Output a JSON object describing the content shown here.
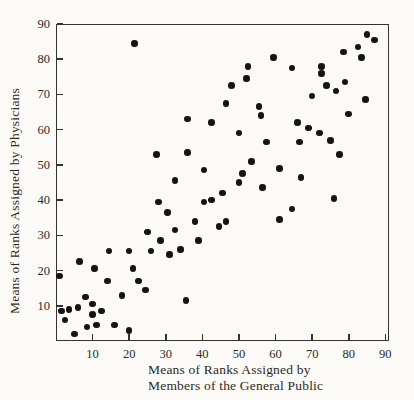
{
  "figure": {
    "background_color": "#fbfaf7",
    "ink_color": "#16140f",
    "axis_color": "#35332e"
  },
  "chart_data": {
    "type": "scatter",
    "title": "",
    "ylabel": "Means of Ranks Assigned by Physicians",
    "xlabel_lines": [
      "Means of Ranks Assigned by",
      "Members of the General Public"
    ],
    "xlim": [
      0,
      91
    ],
    "ylim": [
      0,
      90
    ],
    "x_ticks": [
      10,
      20,
      30,
      40,
      50,
      60,
      70,
      80,
      90
    ],
    "y_ticks": [
      10,
      20,
      30,
      40,
      50,
      60,
      70,
      80,
      90
    ],
    "grid": false,
    "legend": "none",
    "marker": "filled-circle",
    "points": [
      [
        1,
        18.5
      ],
      [
        6.5,
        22.5
      ],
      [
        10.5,
        20.5
      ],
      [
        14,
        17
      ],
      [
        8,
        12.5
      ],
      [
        18,
        13
      ],
      [
        1.5,
        8.5
      ],
      [
        3.5,
        9
      ],
      [
        6,
        9.5
      ],
      [
        10,
        10.5
      ],
      [
        2.5,
        6
      ],
      [
        10,
        7.5
      ],
      [
        12.5,
        8.5
      ],
      [
        8.5,
        4
      ],
      [
        11,
        4.5
      ],
      [
        16,
        4.5
      ],
      [
        20,
        3
      ],
      [
        5,
        2
      ],
      [
        22.5,
        17
      ],
      [
        24.5,
        14.5
      ],
      [
        35.5,
        11.5
      ],
      [
        25,
        31
      ],
      [
        28.5,
        28.5
      ],
      [
        26,
        25.5
      ],
      [
        30.5,
        36.5
      ],
      [
        32.5,
        31.5
      ],
      [
        31,
        24.5
      ],
      [
        34,
        26
      ],
      [
        38,
        34
      ],
      [
        39,
        28.5
      ],
      [
        40.5,
        39.5
      ],
      [
        42.5,
        40
      ],
      [
        44.5,
        32.5
      ],
      [
        46.5,
        34
      ],
      [
        14.5,
        25.5
      ],
      [
        20,
        25.5
      ],
      [
        21,
        20.5
      ],
      [
        28,
        39.5
      ],
      [
        52.5,
        78
      ],
      [
        52,
        74.5
      ],
      [
        48,
        72.5
      ],
      [
        46.5,
        67.5
      ],
      [
        55.5,
        66.5
      ],
      [
        56,
        64
      ],
      [
        36,
        63
      ],
      [
        42.5,
        62
      ],
      [
        50,
        59
      ],
      [
        57.5,
        56.5
      ],
      [
        59.5,
        80.5
      ],
      [
        36,
        53.5
      ],
      [
        21.5,
        84.5
      ],
      [
        27.5,
        53
      ],
      [
        53.5,
        51
      ],
      [
        40.5,
        48.5
      ],
      [
        51,
        47.5
      ],
      [
        32.5,
        45.5
      ],
      [
        50,
        45
      ],
      [
        56.5,
        43.5
      ],
      [
        45.5,
        42
      ],
      [
        85,
        87
      ],
      [
        87,
        85.5
      ],
      [
        82.5,
        83.5
      ],
      [
        78.5,
        82
      ],
      [
        83.5,
        80.5
      ],
      [
        64.5,
        77.5
      ],
      [
        72.5,
        78
      ],
      [
        72.5,
        76
      ],
      [
        74,
        72.5
      ],
      [
        79,
        73.5
      ],
      [
        76.5,
        71
      ],
      [
        70,
        69.5
      ],
      [
        84.5,
        68.5
      ],
      [
        80,
        64.5
      ],
      [
        66,
        62
      ],
      [
        69,
        60.5
      ],
      [
        72,
        59
      ],
      [
        66.5,
        56.5
      ],
      [
        75,
        57
      ],
      [
        77.5,
        53
      ],
      [
        61,
        49
      ],
      [
        67,
        46.5
      ],
      [
        76,
        40.5
      ],
      [
        64.5,
        37.5
      ],
      [
        61,
        34.5
      ]
    ]
  },
  "layout": {
    "plot_left": 56,
    "plot_top": 24,
    "plot_right": 389,
    "plot_bottom": 341
  }
}
